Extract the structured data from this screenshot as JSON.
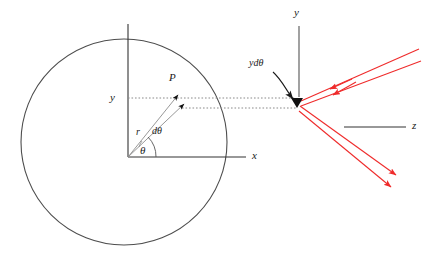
{
  "figure": {
    "background_color": "#ffffff",
    "width": 428,
    "height": 279
  },
  "colors": {
    "outline": "#4d4d4d",
    "axis": "#1a1a1a",
    "dotted": "#808080",
    "ray": "#ef2b2b",
    "label": "#1a1a1a",
    "thin_line": "#8c8c8c"
  },
  "labels": {
    "point_p": "P",
    "y_axis_left": "y",
    "x_axis": "x",
    "radius_vector": "r",
    "angle_increment": "dθ",
    "theta": "θ",
    "arc_length": "ydθ",
    "y_axis_right": "y",
    "z_axis": "z"
  },
  "geometry": {
    "circle": {
      "cx": 124,
      "cy": 142,
      "r": 103
    },
    "origin": {
      "x": 128,
      "y": 157
    },
    "vertical_axis": {
      "x": 128,
      "y_top": 24,
      "y_bottom": 157
    },
    "x_axis": {
      "x_start": 128,
      "x_end": 246,
      "y": 157
    },
    "point_p_tip": {
      "x": 180,
      "y": 97
    },
    "second_ray_tip": {
      "x": 186,
      "y": 106
    },
    "convergence": {
      "x": 298,
      "y": 104
    },
    "theta_arc_radius": 24,
    "right_y_axis": {
      "x": 299,
      "y_top": 26,
      "y_bottom": 97
    },
    "z_axis_line": {
      "x_start": 344,
      "x_end": 405,
      "y": 127
    }
  },
  "rays": {
    "incoming": [
      {
        "name": "incident-ray-upper",
        "from_x": 418,
        "from_y": 50,
        "to_x": 300,
        "to_y": 102,
        "arrow_x": 330,
        "arrow_y": 89,
        "direction": "toward-origin"
      },
      {
        "name": "incident-ray-lower",
        "from_x": 420,
        "from_y": 62,
        "to_x": 300,
        "to_y": 106,
        "arrow_x": 332,
        "arrow_y": 95,
        "direction": "toward-origin"
      }
    ],
    "outgoing": [
      {
        "name": "reflected-ray-upper",
        "from_x": 300,
        "from_y": 106,
        "to_x": 397,
        "to_y": 176,
        "direction": "away-from-origin"
      },
      {
        "name": "reflected-ray-lower",
        "from_x": 299,
        "from_y": 110,
        "to_x": 392,
        "to_y": 188,
        "direction": "away-from-origin"
      }
    ]
  },
  "dotted_lines": [
    {
      "name": "upper-dotted-horizontal",
      "x_start": 128,
      "x_end": 298,
      "y": 98
    },
    {
      "name": "lower-dotted-horizontal",
      "x_start": 180,
      "x_end": 298,
      "y": 108
    }
  ]
}
